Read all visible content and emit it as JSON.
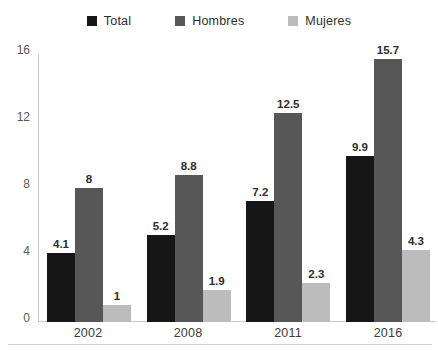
{
  "chart_data": {
    "type": "bar",
    "title": "",
    "subtitle": "",
    "xlabel": "",
    "ylabel": "",
    "categories": [
      "2002",
      "2008",
      "2011",
      "2016"
    ],
    "series": [
      {
        "name": "Total",
        "color": "#161616",
        "values": [
          4.1,
          5.2,
          7.2,
          9.9
        ],
        "labels": [
          "4.1",
          "5.2",
          "7.2",
          "9.9"
        ]
      },
      {
        "name": "Hombres",
        "color": "#575757",
        "values": [
          8.0,
          8.8,
          12.5,
          15.7
        ],
        "labels": [
          "8",
          "8.8",
          "12.5",
          "15.7"
        ]
      },
      {
        "name": "Mujeres",
        "color": "#bcbcbc",
        "values": [
          1.0,
          1.9,
          2.3,
          4.3
        ],
        "labels": [
          "1",
          "1.9",
          "2.3",
          "4.3"
        ]
      }
    ],
    "yticks": [
      0,
      4,
      8,
      12,
      16
    ],
    "ytick_labels": [
      "0",
      "4",
      "8",
      "12",
      "16"
    ],
    "ylim": [
      0,
      16
    ],
    "grid": false,
    "legend_position": "top-center",
    "legend": [
      {
        "label": "Total",
        "color": "#161616",
        "icon": "legend-square-icon"
      },
      {
        "label": "Hombres",
        "color": "#575757",
        "icon": "legend-square-icon"
      },
      {
        "label": "Mujeres",
        "color": "#bcbcbc",
        "icon": "legend-square-icon"
      }
    ]
  }
}
